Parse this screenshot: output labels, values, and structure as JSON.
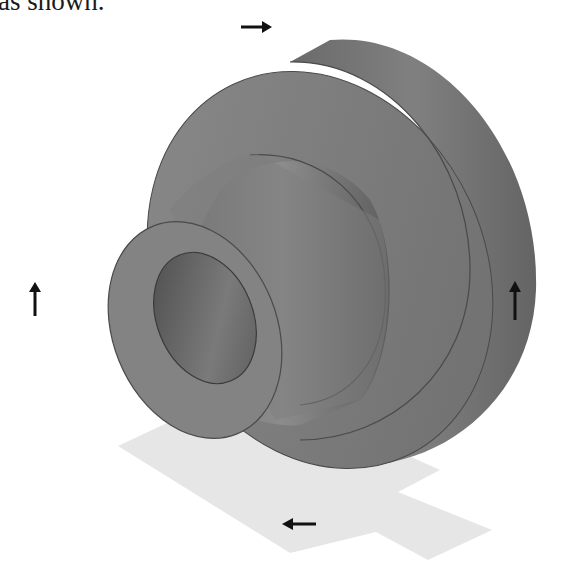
{
  "document": {
    "caption_fragment": "as shown.",
    "figure": {
      "subject": "isometric-stepped-bushing",
      "annotation_label": "e",
      "arrows": [
        {
          "id": "top",
          "direction": "right"
        },
        {
          "id": "left",
          "direction": "up"
        },
        {
          "id": "right",
          "direction": "up"
        },
        {
          "id": "bottom",
          "direction": "left"
        }
      ],
      "colors": {
        "part_fill": "#7a7a7a",
        "part_shadow": "#5c5c5c",
        "part_highlight": "#8e8e8e",
        "ground_plane": "#e6e6e6",
        "arrow": "#111111"
      }
    }
  }
}
